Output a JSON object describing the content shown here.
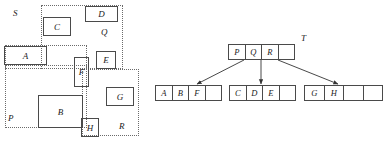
{
  "diagram": {
    "title_left": "spatial-mbr-layout",
    "title_right": "r-tree-structure"
  },
  "spatial": {
    "mbrs": [
      {
        "name": "S",
        "label": "S",
        "x": 5,
        "y": 45,
        "w": 82,
        "h": 24,
        "label_x": 13,
        "label_y": 9
      },
      {
        "name": "Q",
        "label": "Q",
        "x": 41,
        "y": 5,
        "w": 82,
        "h": 64,
        "label_x": 101,
        "label_y": 28
      },
      {
        "name": "P",
        "label": "P",
        "x": 5,
        "y": 65,
        "w": 82,
        "h": 63,
        "label_x": 8,
        "label_y": 114
      },
      {
        "name": "R",
        "label": "R",
        "x": 82,
        "y": 69,
        "w": 57,
        "h": 67,
        "label_x": 119,
        "label_y": 122
      }
    ],
    "rects": [
      {
        "name": "A",
        "label": "A",
        "x": 4,
        "y": 46,
        "w": 43,
        "h": 19
      },
      {
        "name": "B",
        "label": "B",
        "x": 38,
        "y": 95,
        "w": 45,
        "h": 33
      },
      {
        "name": "C",
        "label": "C",
        "x": 43,
        "y": 17,
        "w": 28,
        "h": 19
      },
      {
        "name": "D",
        "label": "D",
        "x": 85,
        "y": 6,
        "w": 33,
        "h": 16
      },
      {
        "name": "E",
        "label": "E",
        "x": 96,
        "y": 51,
        "w": 20,
        "h": 18
      },
      {
        "name": "F",
        "label": "F",
        "x": 74,
        "y": 57,
        "w": 15,
        "h": 30
      },
      {
        "name": "G",
        "label": "G",
        "x": 106,
        "y": 87,
        "w": 28,
        "h": 19
      },
      {
        "name": "H",
        "label": "H",
        "x": 81,
        "y": 118,
        "w": 18,
        "h": 19
      }
    ]
  },
  "tree": {
    "root_label": "T",
    "root_label_x": 301,
    "root_label_y": 34,
    "nodes": [
      {
        "name": "root-node",
        "x": 228,
        "y": 44,
        "w": 67,
        "h": 16,
        "cells": [
          "P",
          "Q",
          "R",
          ""
        ]
      },
      {
        "name": "leaf-node-1",
        "x": 155,
        "y": 85,
        "w": 67,
        "h": 16,
        "cells": [
          "A",
          "B",
          "F",
          ""
        ]
      },
      {
        "name": "leaf-node-2",
        "x": 229,
        "y": 85,
        "w": 67,
        "h": 16,
        "cells": [
          "C",
          "D",
          "E",
          ""
        ]
      },
      {
        "name": "leaf-node-3",
        "x": 304,
        "y": 85,
        "w": 79,
        "h": 16,
        "cells": [
          "G",
          "H",
          "",
          ""
        ]
      }
    ],
    "edges": [
      {
        "name": "edge-p-to-leaf1",
        "x1": 244,
        "y1": 60,
        "x2": 197,
        "y2": 84
      },
      {
        "name": "edge-q-to-leaf2",
        "x1": 261,
        "y1": 60,
        "x2": 261,
        "y2": 84
      },
      {
        "name": "edge-r-to-leaf3",
        "x1": 278,
        "y1": 60,
        "x2": 338,
        "y2": 84
      }
    ]
  }
}
